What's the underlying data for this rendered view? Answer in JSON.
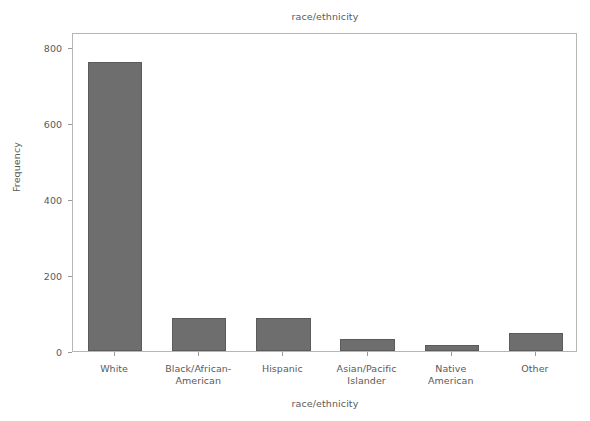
{
  "chart_data": {
    "type": "bar",
    "title": "race/ethnicity",
    "xlabel": "race/ethnicity",
    "ylabel": "Frequency",
    "categories": [
      "White",
      "Black/African-\nAmerican",
      "Hispanic",
      "Asian/Pacific\nIslander",
      "Native\nAmerican",
      "Other"
    ],
    "values": [
      760,
      86,
      86,
      31,
      15,
      47
    ],
    "ylim": [
      0,
      840
    ],
    "yticks": [
      0,
      200,
      400,
      600,
      800
    ],
    "ytick_labels": [
      "0",
      "200",
      "400",
      "600",
      "800"
    ],
    "grid": false,
    "legend": "none",
    "bar_color": "#6e6e6e",
    "bar_edge_color": "#5b5b5b",
    "frame_color": "#b6b6b6",
    "text_color": "#5a5a5a",
    "background": "#ffffff"
  }
}
